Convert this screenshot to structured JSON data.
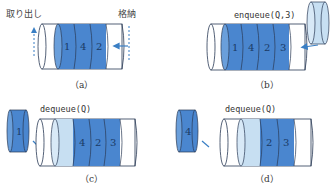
{
  "colors": {
    "dark_blue": "#4a86cf",
    "light_blue": "#c7dff2",
    "outline": "#2a3a55",
    "arrow": "#3a7fc4"
  },
  "panels": [
    {
      "id": "a",
      "caption": "（a）",
      "labels": {
        "left": "取り出し",
        "right": "格納"
      },
      "queue": [
        "1",
        "4",
        "2"
      ]
    },
    {
      "id": "b",
      "caption": "（b）",
      "operation": "enqueue(Q,3)",
      "queue": [
        "1",
        "4",
        "2",
        "3"
      ]
    },
    {
      "id": "c",
      "caption": "（c）",
      "operation": "dequeue(Q)",
      "removed": "1",
      "queue": [
        "4",
        "2",
        "3"
      ]
    },
    {
      "id": "d",
      "caption": "（d）",
      "operation": "dequeue(Q)",
      "removed": "4",
      "queue": [
        "2",
        "3"
      ]
    }
  ]
}
